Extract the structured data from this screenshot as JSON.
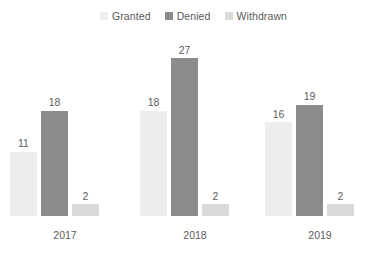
{
  "chart_data": {
    "type": "bar",
    "title": "",
    "subtitle": "",
    "xlabel": "",
    "ylabel": "",
    "categories": [
      "2017",
      "2018",
      "2019"
    ],
    "series": [
      {
        "name": "Granted",
        "values": [
          11,
          18,
          16
        ],
        "color": "#ededed"
      },
      {
        "name": "Denied",
        "values": [
          18,
          27,
          19
        ],
        "color": "#8c8c8c"
      },
      {
        "name": "Withdrawn",
        "values": [
          2,
          2,
          2
        ],
        "color": "#d9d9d9"
      }
    ],
    "ylim": [
      0,
      30
    ],
    "grid": false,
    "axis_lines": false,
    "data_labels": true,
    "legend": {
      "show": true,
      "position": "top-center",
      "orientation": "horizontal"
    }
  },
  "legend": {
    "items": [
      {
        "label": "Granted",
        "swatch": "legend-swatch-granted"
      },
      {
        "label": "Denied",
        "swatch": "legend-swatch-denied"
      },
      {
        "label": "Withdrawn",
        "swatch": "legend-swatch-withdrawn"
      }
    ]
  },
  "groups": [
    {
      "category": "2017",
      "bars": [
        {
          "series": "Granted",
          "value": "11"
        },
        {
          "series": "Denied",
          "value": "18"
        },
        {
          "series": "Withdrawn",
          "value": "2"
        }
      ]
    },
    {
      "category": "2018",
      "bars": [
        {
          "series": "Granted",
          "value": "18"
        },
        {
          "series": "Denied",
          "value": "27"
        },
        {
          "series": "Withdrawn",
          "value": "2"
        }
      ]
    },
    {
      "category": "2019",
      "bars": [
        {
          "series": "Granted",
          "value": "16"
        },
        {
          "series": "Denied",
          "value": "19"
        },
        {
          "series": "Withdrawn",
          "value": "2"
        }
      ]
    }
  ],
  "colors": {
    "granted": "#ededed",
    "denied": "#8c8c8c",
    "withdrawn": "#d9d9d9",
    "text": "#5d5d5d",
    "background": "#ffffff"
  }
}
